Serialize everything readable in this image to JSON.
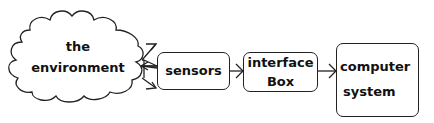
{
  "diagram": {
    "nodes": [
      {
        "id": "environment",
        "shape": "cloud",
        "lines": [
          "the",
          "environment"
        ]
      },
      {
        "id": "sensors",
        "shape": "rounded-box",
        "lines": [
          "sensors"
        ]
      },
      {
        "id": "interface",
        "shape": "rounded-box",
        "lines": [
          "interface",
          "Box"
        ]
      },
      {
        "id": "computer",
        "shape": "rounded-box",
        "lines": [
          "computer",
          "system"
        ]
      }
    ],
    "edges": [
      {
        "from": "sensors",
        "to": "environment",
        "count": 3,
        "style": "fan-out arrows"
      },
      {
        "from": "sensors",
        "to": "interface",
        "style": "arrow"
      },
      {
        "from": "interface",
        "to": "computer",
        "style": "arrow"
      }
    ],
    "stroke_color": "#222222",
    "background": "#ffffff"
  }
}
